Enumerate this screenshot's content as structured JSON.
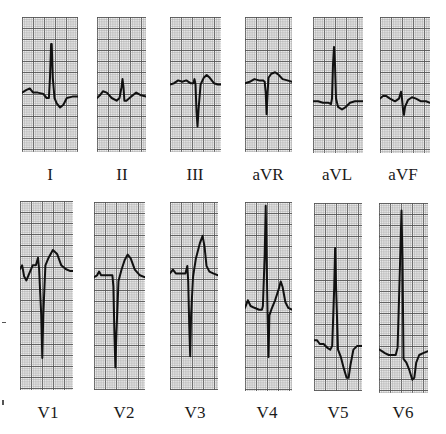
{
  "figure": {
    "grid": {
      "small_px": 2.2,
      "large_every": 5,
      "paper_color": "#f4f4f4",
      "small_line_color": "#9a9a9a",
      "large_line_color": "#555555",
      "trace_color": "#111111"
    }
  },
  "rows": [
    {
      "leads": [
        {
          "label": "I",
          "box": [
            22,
            17,
            56,
            135
          ],
          "baseline_frac": 0.57,
          "trace": "0,0.56 0.08,0.54 0.14,0.53 0.2,0.56 0.28,0.56 0.38,0.57 0.44,0.6 0.48,0.6 0.5,0.45 0.52,0.2 0.53,0.2 0.55,0.45 0.58,0.6 0.62,0.64 0.68,0.67 0.74,0.65 0.8,0.6 0.9,0.59 1,0.59"
        },
        {
          "label": "II",
          "box": [
            97,
            17,
            49,
            135
          ],
          "baseline_frac": 0.6,
          "trace": "0,0.6 0.06,0.58 0.12,0.55 0.2,0.56 0.3,0.6 0.4,0.62 0.46,0.6 0.5,0.52 0.52,0.46 0.54,0.52 0.56,0.62 0.6,0.62 0.7,0.59 0.8,0.56 0.9,0.58 1,0.59"
        },
        {
          "label": "III",
          "box": [
            170,
            17,
            51,
            135
          ],
          "baseline_frac": 0.5,
          "trace": "0,0.5 0.08,0.49 0.16,0.47 0.24,0.48 0.32,0.47 0.4,0.49 0.46,0.49 0.48,0.46 0.5,0.5 0.52,0.7 0.54,0.81 0.56,0.68 0.6,0.5 0.66,0.45 0.72,0.43 0.78,0.45 0.86,0.49 0.94,0.5 1,0.5"
        },
        {
          "label": "aVR",
          "box": [
            245,
            17,
            47,
            135
          ],
          "baseline_frac": 0.48,
          "trace": "0,0.49 0.1,0.48 0.2,0.46 0.3,0.47 0.38,0.47 0.42,0.48 0.44,0.56 0.46,0.72 0.48,0.56 0.5,0.45 0.56,0.42 0.64,0.41 0.72,0.43 0.8,0.46 0.9,0.47 1,0.48"
        },
        {
          "label": "aVL",
          "box": [
            313,
            17,
            50,
            136
          ],
          "baseline_frac": 0.62,
          "trace": "0,0.62 0.1,0.62 0.2,0.63 0.3,0.63 0.36,0.64 0.38,0.6 0.4,0.35 0.42,0.22 0.44,0.35 0.46,0.6 0.5,0.66 0.58,0.68 0.66,0.66 0.74,0.63 0.84,0.62 0.94,0.62 1,0.62"
        },
        {
          "label": "aVF",
          "box": [
            380,
            17,
            50,
            136
          ],
          "baseline_frac": 0.6,
          "trace": "0,0.6 0.06,0.58 0.12,0.58 0.2,0.6 0.3,0.62 0.38,0.6 0.42,0.55 0.44,0.6 0.46,0.68 0.48,0.72 0.5,0.66 0.56,0.61 0.64,0.59 0.72,0.6 0.82,0.62 0.92,0.62 1,0.63"
        }
      ],
      "label_y": 166
    },
    {
      "leads": [
        {
          "label": "V1",
          "box": [
            20,
            201,
            53,
            189
          ],
          "baseline_frac": 0.36,
          "trace": "0,0.36 0.04,0.34 0.08,0.4 0.12,0.42 0.18,0.38 0.24,0.34 0.3,0.34 0.34,0.3 0.36,0.36 0.4,0.6 0.42,0.83 0.44,0.6 0.48,0.34 0.54,0.3 0.62,0.26 0.7,0.28 0.78,0.34 0.86,0.36 0.94,0.37 1,0.37"
        },
        {
          "label": "V2",
          "box": [
            94,
            202,
            51,
            188
          ],
          "baseline_frac": 0.4,
          "trace": "0,0.4 0.06,0.39 0.1,0.37 0.14,0.39 0.22,0.39 0.3,0.39 0.36,0.39 0.38,0.45 0.4,0.7 0.42,0.88 0.44,0.7 0.48,0.42 0.54,0.36 0.6,0.31 0.66,0.28 0.72,0.3 0.8,0.36 0.9,0.39 1,0.4"
        },
        {
          "label": "V3",
          "box": [
            170,
            202,
            48,
            188
          ],
          "baseline_frac": 0.38,
          "trace": "0,0.38 0.06,0.36 0.12,0.38 0.2,0.38 0.28,0.38 0.32,0.38 0.36,0.34 0.38,0.42 0.4,0.65 0.42,0.82 0.44,0.6 0.48,0.4 0.54,0.3 0.62,0.22 0.68,0.18 0.72,0.24 0.76,0.34 0.82,0.37 0.9,0.38 1,0.39"
        },
        {
          "label": "V4",
          "box": [
            245,
            202,
            47,
            189
          ],
          "baseline_frac": 0.55,
          "trace": "0,0.56 0.06,0.52 0.12,0.55 0.2,0.56 0.3,0.57 0.36,0.57 0.38,0.55 0.42,0.28 0.44,0.02 0.46,0.3 0.48,0.6 0.5,0.82 0.52,0.6 0.56,0.57 0.64,0.52 0.72,0.46 0.76,0.42 0.8,0.45 0.86,0.53 0.92,0.56 1,0.57"
        },
        {
          "label": "V5",
          "box": [
            314,
            203,
            48,
            188
          ],
          "baseline_frac": 0.73,
          "trace": "0,0.73 0.06,0.73 0.12,0.75 0.2,0.75 0.28,0.77 0.34,0.78 0.38,0.76 0.42,0.45 0.44,0.24 0.46,0.45 0.5,0.78 0.56,0.82 0.62,0.88 0.68,0.93 0.72,0.93 0.76,0.86 0.82,0.78 0.9,0.76 1,0.76"
        },
        {
          "label": "V6",
          "box": [
            379,
            203,
            49,
            190
          ],
          "baseline_frac": 0.78,
          "trace": "0,0.77 0.06,0.78 0.12,0.79 0.2,0.8 0.28,0.8 0.34,0.8 0.38,0.76 0.42,0.4 0.46,0.04 0.48,0.3 0.5,0.82 0.56,0.84 0.62,0.88 0.68,0.93 0.72,0.92 0.76,0.84 0.82,0.8 0.9,0.79 1,0.78"
        }
      ],
      "label_y": 404
    }
  ]
}
